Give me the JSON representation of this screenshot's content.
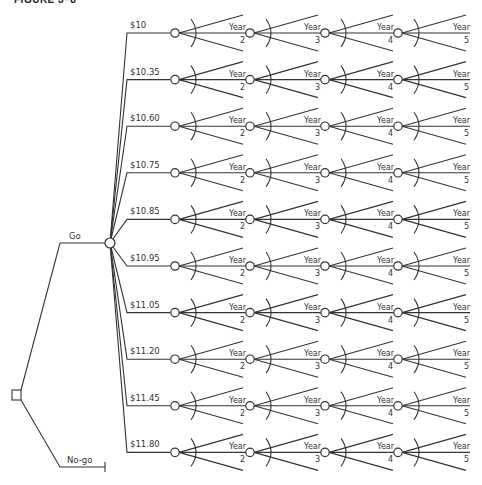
{
  "figure": {
    "title": "FIGURE 3–8",
    "line_color": "#333333",
    "background": "#ffffff"
  },
  "decision": {
    "go_label": "Go",
    "nogo_label": "No-go"
  },
  "price_branches": [
    "$10",
    "$10.35",
    "$10.60",
    "$10.75",
    "$10.85",
    "$10.95",
    "$11.05",
    "$11.20",
    "$11.45",
    "$11.80"
  ],
  "year_labels": [
    {
      "word": "Year",
      "num": "2"
    },
    {
      "word": "Year",
      "num": "3"
    },
    {
      "word": "Year",
      "num": "4"
    },
    {
      "word": "Year",
      "num": "5"
    }
  ]
}
